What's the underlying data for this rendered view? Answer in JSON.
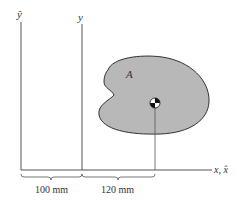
{
  "diagram": {
    "type": "parallel-axis-theorem figure",
    "axes": {
      "y_hat_label": "ŷ",
      "y_label": "y",
      "x_label": "x, x̂"
    },
    "area": {
      "label": "A",
      "fill_color": "#b8b8b8",
      "outline_color": "#333333"
    },
    "centroid": {
      "symbol": "centroid-marker"
    },
    "dimensions": [
      {
        "label": "100 mm",
        "from": "ŷ axis",
        "to": "y axis"
      },
      {
        "label": "120 mm",
        "from": "y axis",
        "to": "centroid"
      }
    ]
  }
}
